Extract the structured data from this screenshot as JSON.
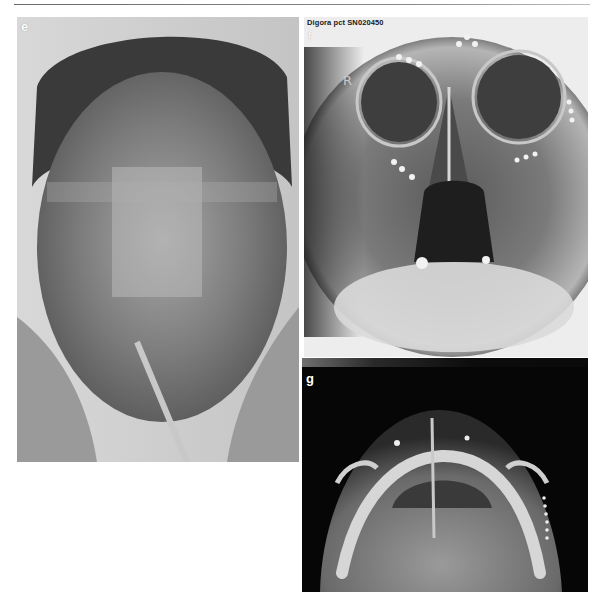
{
  "page": {
    "header_rule": true
  },
  "figure": {
    "panels": [
      {
        "id": "e",
        "label": "e",
        "type": "clinical-photograph",
        "description": "Frontal clinical photograph of patient's face with facial trauma, tape over nose/forehead and oral tube"
      },
      {
        "id": "f",
        "label": "f",
        "type": "radiograph-pa-skull",
        "caption_text": "Digora pct SN020450",
        "side_marker": "R",
        "description": "Posteroanterior skull radiograph with osteosynthesis plates at orbital rims and zygoma"
      },
      {
        "id": "g",
        "label": "g",
        "type": "radiograph-submentovertex",
        "description": "Submentovertex (axial) radiograph showing mandible and zygomatic arches"
      }
    ]
  },
  "colors": {
    "background": "#ffffff",
    "rule": "#7a7a7a",
    "label": "#ffffff",
    "caption": "#1a1a1a"
  }
}
